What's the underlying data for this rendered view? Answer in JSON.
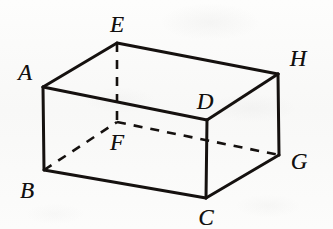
{
  "figure": {
    "kind": "geometry-diagram",
    "stroke_color": "#15110f",
    "background_color": "#fbfbfa",
    "solid_stroke_width": 3,
    "dashed_stroke_width": 2.6,
    "dash_pattern": "9 8",
    "label_font_size": 23
  },
  "vertices": [
    {
      "id": "A",
      "label": "A",
      "point": {
        "x": 43,
        "y": 87
      },
      "label_pos": {
        "x": 25,
        "y": 72
      },
      "hidden": false
    },
    {
      "id": "B",
      "label": "B",
      "point": {
        "x": 44,
        "y": 170
      },
      "label_pos": {
        "x": 27,
        "y": 190
      },
      "hidden": false
    },
    {
      "id": "C",
      "label": "C",
      "point": {
        "x": 206,
        "y": 198
      },
      "label_pos": {
        "x": 206,
        "y": 217
      },
      "hidden": false
    },
    {
      "id": "D",
      "label": "D",
      "point": {
        "x": 207,
        "y": 120
      },
      "label_pos": {
        "x": 205,
        "y": 101
      },
      "hidden": false
    },
    {
      "id": "E",
      "label": "E",
      "point": {
        "x": 117,
        "y": 43
      },
      "label_pos": {
        "x": 117,
        "y": 24
      },
      "hidden": false
    },
    {
      "id": "F",
      "label": "F",
      "point": {
        "x": 117,
        "y": 122
      },
      "label_pos": {
        "x": 117,
        "y": 142
      },
      "hidden": true
    },
    {
      "id": "G",
      "label": "G",
      "point": {
        "x": 279,
        "y": 155
      },
      "label_pos": {
        "x": 299,
        "y": 161
      },
      "hidden": false
    },
    {
      "id": "H",
      "label": "H",
      "point": {
        "x": 278,
        "y": 74
      },
      "label_pos": {
        "x": 298,
        "y": 58
      },
      "hidden": false
    }
  ],
  "edges": {
    "solid": [
      {
        "id": "A-E",
        "from": "A",
        "to": "E",
        "d": "M43,87 L117,43"
      },
      {
        "id": "E-H",
        "from": "E",
        "to": "H",
        "d": "M117,43 L278,74"
      },
      {
        "id": "H-D",
        "from": "H",
        "to": "D",
        "d": "M278,74 L207,120"
      },
      {
        "id": "D-A",
        "from": "D",
        "to": "A",
        "d": "M207,120 L43,87"
      },
      {
        "id": "A-B",
        "from": "A",
        "to": "B",
        "d": "M43,87 L44,170"
      },
      {
        "id": "D-C",
        "from": "D",
        "to": "C",
        "d": "M207,120 L206,198"
      },
      {
        "id": "H-G",
        "from": "H",
        "to": "G",
        "d": "M278,74 L279,155"
      },
      {
        "id": "B-C",
        "from": "B",
        "to": "C",
        "d": "M44,170 L206,198"
      },
      {
        "id": "C-G",
        "from": "C",
        "to": "G",
        "d": "M206,198 L279,155"
      }
    ],
    "dashed": [
      {
        "id": "E-F",
        "from": "E",
        "to": "F",
        "d": "M117,43 L117,122"
      },
      {
        "id": "B-F",
        "from": "B",
        "to": "F",
        "d": "M44,170 L117,122"
      },
      {
        "id": "F-G",
        "from": "F",
        "to": "G",
        "d": "M117,122 L279,155"
      }
    ]
  },
  "faces": {
    "top": [
      "A",
      "E",
      "H",
      "D"
    ],
    "bottom": [
      "B",
      "F",
      "G",
      "C"
    ],
    "front_left": [
      "A",
      "B",
      "C",
      "D"
    ],
    "right": [
      "D",
      "C",
      "G",
      "H"
    ]
  }
}
